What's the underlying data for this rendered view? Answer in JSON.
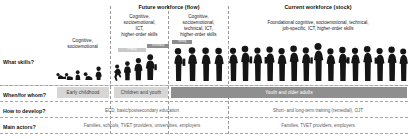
{
  "headers": {
    "future": {
      "title": "Future workforce (flow)",
      "id": "future-workforce-flow"
    },
    "current": {
      "title": "Current workforce (stock)",
      "id": "current-workforce-stock",
      "subtitle_line1": "Foundational cognitive, socioemotional, technical,",
      "subtitle_line2": "job-specific, ICT, higher-order skills"
    }
  },
  "skills": {
    "col1": [
      "Cognitive,",
      "socioemotional"
    ],
    "col2": [
      "Cognitive,",
      "socioemotional,",
      "ICT,",
      "higher-order skills"
    ],
    "col3": [
      "Cognitive,",
      "socioemotional,",
      "technical, ICT,",
      "higher-order skills"
    ]
  },
  "step_bars": [
    {
      "label": "Primary"
    },
    {
      "label": "Secondary"
    },
    {
      "label": "Tertiary"
    }
  ],
  "rows": [
    {
      "id": "what-skills",
      "label": "What skills?"
    },
    {
      "id": "when-for-whom",
      "label": "When/for whom?",
      "bands": [
        {
          "id": "band-early-childhood",
          "text": "Early childhood",
          "tone": "light"
        },
        {
          "id": "band-children-and-youth",
          "text": "Children and youth",
          "tone": "light"
        },
        {
          "id": "band-youth-and-older-adults",
          "text": "Youth and older adults",
          "tone": "dark"
        }
      ]
    },
    {
      "id": "how-to-develop",
      "label": "How to develop?",
      "left_value": "ECD, basic/postsecondary education",
      "right_value": "Short- and long-term training (remedial), OJT"
    },
    {
      "id": "main-actors",
      "label": "Main actors?",
      "left_value": "Families, schools, TVET providers, universities, employers",
      "right_value": "Families, TVET providers, employers"
    }
  ],
  "colors": {
    "band_dark": "#8f8f8f",
    "band_light": "#d6d6d6",
    "silhouette": "#151515",
    "dash": "#9a9a9a",
    "muted_text": "#5a5a5a"
  }
}
